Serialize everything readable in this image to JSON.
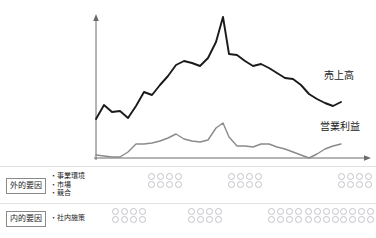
{
  "chart_data": {
    "type": "line",
    "title": "",
    "xlabel": "",
    "ylabel": "",
    "grid": false,
    "legend_position": "right-inline",
    "axis": {
      "x_start_px": 96,
      "x_end_px": 370,
      "baseline_px": 158,
      "y_top_px": 16,
      "y_axis_x_px": 96
    },
    "series": [
      {
        "name": "売上高",
        "color": "#1a1a1a",
        "width": 1.9,
        "points": [
          [
            96,
            119
          ],
          [
            104,
            105
          ],
          [
            112,
            112
          ],
          [
            120,
            111
          ],
          [
            128,
            118
          ],
          [
            136,
            106
          ],
          [
            144,
            92
          ],
          [
            152,
            95
          ],
          [
            160,
            85
          ],
          [
            168,
            76
          ],
          [
            176,
            65
          ],
          [
            184,
            61
          ],
          [
            192,
            63
          ],
          [
            200,
            66
          ],
          [
            208,
            58
          ],
          [
            216,
            42
          ],
          [
            223,
            17
          ],
          [
            229,
            54
          ],
          [
            237,
            55
          ],
          [
            245,
            61
          ],
          [
            253,
            66
          ],
          [
            261,
            64
          ],
          [
            269,
            68
          ],
          [
            277,
            73
          ],
          [
            285,
            78
          ],
          [
            293,
            79
          ],
          [
            301,
            85
          ],
          [
            309,
            94
          ],
          [
            317,
            99
          ],
          [
            325,
            103
          ],
          [
            333,
            106
          ],
          [
            341,
            102
          ]
        ]
      },
      {
        "name": "営業利益",
        "color": "#8a8a8a",
        "width": 1.4,
        "points": [
          [
            96,
            155
          ],
          [
            104,
            156
          ],
          [
            112,
            157
          ],
          [
            120,
            157
          ],
          [
            128,
            152
          ],
          [
            136,
            144
          ],
          [
            144,
            144
          ],
          [
            152,
            143
          ],
          [
            160,
            141
          ],
          [
            168,
            138
          ],
          [
            176,
            134
          ],
          [
            184,
            139
          ],
          [
            192,
            141
          ],
          [
            200,
            142
          ],
          [
            208,
            140
          ],
          [
            216,
            128
          ],
          [
            223,
            123
          ],
          [
            229,
            137
          ],
          [
            237,
            146
          ],
          [
            245,
            146
          ],
          [
            253,
            147
          ],
          [
            261,
            144
          ],
          [
            269,
            144
          ],
          [
            277,
            147
          ],
          [
            285,
            149
          ],
          [
            293,
            152
          ],
          [
            301,
            155
          ],
          [
            309,
            158
          ],
          [
            317,
            154
          ],
          [
            325,
            149
          ],
          [
            333,
            146
          ],
          [
            341,
            144
          ]
        ]
      }
    ]
  },
  "legend": {
    "sales_label": "売上高",
    "profit_label": "営業利益"
  },
  "factors": {
    "external": {
      "box_label": "外的要因",
      "items": [
        "・事業環境",
        "・市場",
        "・競合"
      ],
      "clusters": [
        {
          "x": 148,
          "y": 173,
          "rows": 2,
          "cols": 4
        },
        {
          "x": 228,
          "y": 173,
          "rows": 2,
          "cols": 4
        },
        {
          "x": 338,
          "y": 173,
          "rows": 2,
          "cols": 4
        }
      ]
    },
    "internal": {
      "box_label": "内的要因",
      "items": [
        "・社内施策"
      ],
      "clusters": [
        {
          "x": 112,
          "y": 208,
          "rows": 2,
          "cols": 4
        },
        {
          "x": 188,
          "y": 208,
          "rows": 2,
          "cols": 4
        },
        {
          "x": 268,
          "y": 208,
          "rows": 2,
          "cols": 4
        },
        {
          "x": 305,
          "y": 208,
          "rows": 2,
          "cols": 4
        },
        {
          "x": 340,
          "y": 208,
          "rows": 2,
          "cols": 4
        }
      ]
    }
  },
  "rules": [
    {
      "y": 166
    },
    {
      "y": 203
    }
  ]
}
